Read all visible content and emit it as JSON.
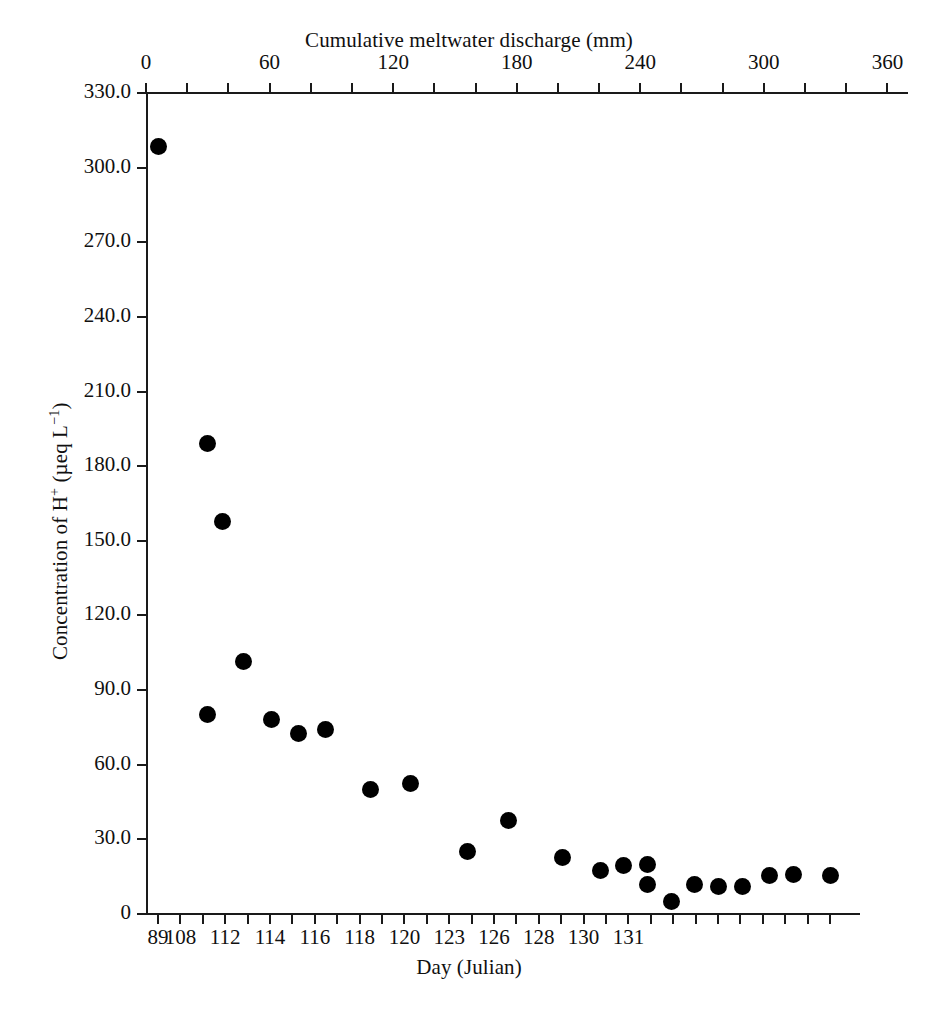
{
  "chart_data": {
    "type": "scatter",
    "title": "",
    "xlabel": "Day (Julian)",
    "ylabel": "Concentration of H+ (µeq L-1)",
    "ylabel_parts": {
      "prefix": "Concentration of H",
      "sup1": "+",
      "middle": " (µeq L",
      "sup2": "−1",
      "suffix": ")"
    },
    "secondary_xlabel": "Cumulative meltwater discharge (mm)",
    "grid": false,
    "legend": null,
    "ylim": [
      0,
      330
    ],
    "yticks": [
      0,
      30,
      60,
      90,
      120,
      150,
      180,
      210,
      240,
      270,
      300,
      330
    ],
    "yticklabels": [
      "0",
      "30.0",
      "60.0",
      "90.0",
      "120.0",
      "150.0",
      "180.0",
      "210.0",
      "240.0",
      "270.0",
      "300.0",
      "330.0"
    ],
    "top_axis": {
      "label": "Cumulative meltwater discharge (mm)",
      "lim": [
        0,
        370
      ],
      "ticks": [
        0,
        20,
        40,
        60,
        80,
        100,
        120,
        140,
        160,
        180,
        200,
        220,
        240,
        260,
        280,
        300,
        320,
        340,
        360
      ],
      "labeled_ticks": [
        0,
        60,
        120,
        180,
        240,
        300,
        360
      ],
      "ticklabels": [
        "0",
        "60",
        "120",
        "180",
        "240",
        "300",
        "360"
      ]
    },
    "bottom_axis": {
      "label": "Day (Julian)",
      "tick_count": 31,
      "labeled_tick_indices": [
        0,
        1,
        3,
        5,
        7,
        9,
        11,
        13,
        15,
        16,
        17,
        18,
        19,
        20,
        21,
        22,
        23,
        24,
        25,
        27,
        29,
        30
      ],
      "labels": [
        {
          "index": 0,
          "text": "89"
        },
        {
          "index": 1,
          "text": "108"
        },
        {
          "index": 3,
          "text": "112"
        },
        {
          "index": 5,
          "text": "114"
        },
        {
          "index": 7,
          "text": "116"
        },
        {
          "index": 9,
          "text": "118"
        },
        {
          "index": 11,
          "text": "120"
        },
        {
          "index": 13,
          "text": "123"
        },
        {
          "index": 15,
          "text": "126"
        },
        {
          "index": 17,
          "text": "128"
        },
        {
          "index": 19,
          "text": "130"
        },
        {
          "index": 21,
          "text": "131"
        }
      ]
    },
    "marker": {
      "shape": "circle",
      "color": "#000000",
      "size_px": 17
    },
    "points": [
      {
        "tick": 0,
        "day": "89",
        "value": 307
      },
      {
        "tick": 2,
        "day": "108",
        "value": 188
      },
      {
        "tick": 2.5,
        "day": "109",
        "value": 157
      },
      {
        "tick": 2,
        "day": "108",
        "value": 81
      },
      {
        "tick": 3.4,
        "day": "110",
        "value": 101
      },
      {
        "tick": 4.5,
        "day": "112",
        "value": 78
      },
      {
        "tick": 5.6,
        "day": "113",
        "value": 74
      },
      {
        "tick": 6.7,
        "day": "114",
        "value": 75
      },
      {
        "tick": 9.0,
        "day": "115",
        "value": 52
      },
      {
        "tick": 10.3,
        "day": "116",
        "value": 54
      },
      {
        "tick": 13.0,
        "day": "117",
        "value": 28
      },
      {
        "tick": 14.6,
        "day": "118",
        "value": 39
      },
      {
        "tick": 17.0,
        "day": "119",
        "value": 24
      },
      {
        "tick": 18.6,
        "day": "120",
        "value": 19
      },
      {
        "tick": 20.0,
        "day": "121",
        "value": 21
      },
      {
        "tick": 21.2,
        "day": "122",
        "value": 21
      },
      {
        "tick": 21.2,
        "day": "122",
        "value": 14
      },
      {
        "tick": 22.4,
        "day": "124",
        "value": 8
      },
      {
        "tick": 23.6,
        "day": "125",
        "value": 14
      },
      {
        "tick": 24.8,
        "day": "126",
        "value": 13
      },
      {
        "tick": 26.0,
        "day": "127",
        "value": 13
      },
      {
        "tick": 27.2,
        "day": "128",
        "value": 18
      },
      {
        "tick": 28.4,
        "day": "130",
        "value": 18
      },
      {
        "tick": 30.4,
        "day": "131",
        "value": 18
      }
    ],
    "points_pixels": [
      {
        "x": 158,
        "y": 146
      },
      {
        "x": 207,
        "y": 443
      },
      {
        "x": 222,
        "y": 521
      },
      {
        "x": 207,
        "y": 714
      },
      {
        "x": 243,
        "y": 661
      },
      {
        "x": 271,
        "y": 719
      },
      {
        "x": 298,
        "y": 733
      },
      {
        "x": 325,
        "y": 729
      },
      {
        "x": 370,
        "y": 789
      },
      {
        "x": 410,
        "y": 783
      },
      {
        "x": 467,
        "y": 851
      },
      {
        "x": 508,
        "y": 820
      },
      {
        "x": 562,
        "y": 857
      },
      {
        "x": 600,
        "y": 870
      },
      {
        "x": 623,
        "y": 865
      },
      {
        "x": 647,
        "y": 864
      },
      {
        "x": 647,
        "y": 884
      },
      {
        "x": 671,
        "y": 901
      },
      {
        "x": 694,
        "y": 884
      },
      {
        "x": 718,
        "y": 886
      },
      {
        "x": 742,
        "y": 886
      },
      {
        "x": 769,
        "y": 875
      },
      {
        "x": 793,
        "y": 874
      },
      {
        "x": 830,
        "y": 875
      }
    ]
  }
}
